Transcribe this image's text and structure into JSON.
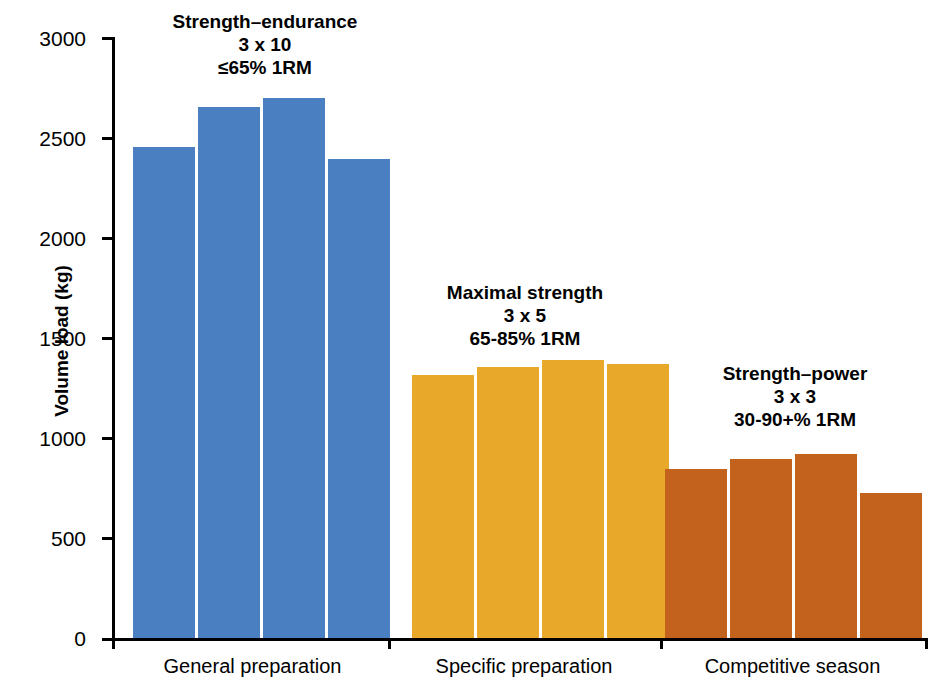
{
  "chart_data": {
    "type": "bar",
    "title": "",
    "xlabel": "",
    "ylabel": "Volume load (kg)",
    "ylim": [
      0,
      3000
    ],
    "yticks": [
      0,
      500,
      1000,
      1500,
      2000,
      2500,
      3000
    ],
    "ytick_labels": [
      "0",
      "500",
      "1000",
      "1500",
      "2000",
      "2500",
      "3000"
    ],
    "grid": false,
    "legend": "none",
    "categories": [
      "General preparation",
      "Specific preparation",
      "Competitive season"
    ],
    "groups": [
      {
        "category": "General preparation",
        "color": "#4a7fc1",
        "annotation": {
          "phase": "Strength–endurance",
          "sets_reps": "3 x 10",
          "intensity": "≤65% 1RM"
        },
        "values": [
          2465,
          2665,
          2710,
          2405
        ]
      },
      {
        "category": "Specific preparation",
        "color": "#e8a92b",
        "annotation": {
          "phase": "Maximal strength",
          "sets_reps": "3 x 5",
          "intensity": "65-85% 1RM"
        },
        "values": [
          1325,
          1365,
          1400,
          1380
        ]
      },
      {
        "category": "Competitive season",
        "color": "#c2621c",
        "annotation": {
          "phase": "Strength–power",
          "sets_reps": "3 x 3",
          "intensity": "30-90+% 1RM"
        },
        "values": [
          855,
          905,
          930,
          735
        ]
      }
    ]
  },
  "axis": {
    "y_title": "Volume load (kg)",
    "tick_0": "0",
    "tick_500": "500",
    "tick_1000": "1000",
    "tick_1500": "1500",
    "tick_2000": "2000",
    "tick_2500": "2500",
    "tick_3000": "3000"
  },
  "groups": {
    "g1": {
      "phase": "Strength–endurance",
      "sets_reps": "3 x 10",
      "intensity": "≤65% 1RM",
      "category": "General preparation"
    },
    "g2": {
      "phase": "Maximal strength",
      "sets_reps": "3 x 5",
      "intensity": "65-85% 1RM",
      "category": "Specific preparation"
    },
    "g3": {
      "phase": "Strength–power",
      "sets_reps": "3 x 3",
      "intensity": "30-90+% 1RM",
      "category": "Competitive season"
    }
  },
  "colors": {
    "series_general": "#4a7fc1",
    "series_specific": "#e8a92b",
    "series_competitive": "#c2621c",
    "axis": "#000000",
    "background": "#ffffff"
  }
}
